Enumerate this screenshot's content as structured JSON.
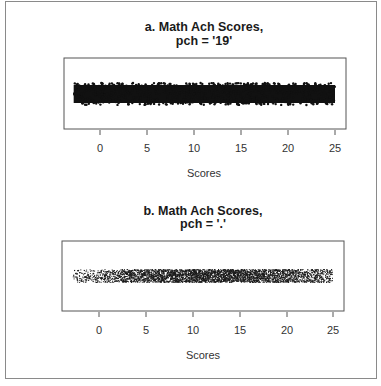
{
  "figure": {
    "border_color": "#8a8a8a",
    "panels": [
      {
        "id": "a",
        "title_line1": "a. Math Ach Scores,",
        "title_line2": "pch = '19'",
        "xlabel": "Scores",
        "ticks": [
          "0",
          "5",
          "10",
          "15",
          "20",
          "25"
        ]
      },
      {
        "id": "b",
        "title_line1": "b. Math Ach Scores,",
        "title_line2": "pch = '.'",
        "xlabel": "Scores",
        "ticks": [
          "0",
          "5",
          "10",
          "15",
          "20",
          "25"
        ]
      }
    ]
  },
  "chart_data": [
    {
      "type": "scatter",
      "title": "a. Math Ach Scores, pch = '19'",
      "xlabel": "Scores",
      "ylabel": "",
      "xlim": [
        -3.8,
        26
      ],
      "x_ticks": [
        0,
        5,
        10,
        15,
        20,
        25
      ],
      "x_range_of_points": [
        -2.8,
        25
      ],
      "marker": "filled circle (pch 19)",
      "y": "jittered (stripchart)",
      "grid": false,
      "legend": null,
      "note": "Points overplot into a solid black band spanning about -2.8 to 25"
    },
    {
      "type": "scatter",
      "title": "b. Math Ach Scores, pch = '.'",
      "xlabel": "Scores",
      "ylabel": "",
      "xlim": [
        -3.8,
        26
      ],
      "x_ticks": [
        0,
        5,
        10,
        15,
        20,
        25
      ],
      "x_range_of_points": [
        -2.8,
        24.9
      ],
      "marker": "dot (pch '.')",
      "y": "jittered (stripchart)",
      "grid": false,
      "legend": null,
      "density_profile": {
        "x": [
          -2.8,
          0,
          2.5,
          5,
          7.5,
          10,
          12.5,
          15,
          17.5,
          20,
          22.5,
          24.9
        ],
        "relative_density": [
          0.15,
          0.3,
          0.5,
          0.75,
          0.9,
          0.95,
          0.95,
          0.9,
          0.8,
          0.65,
          0.5,
          0.3
        ]
      }
    }
  ]
}
